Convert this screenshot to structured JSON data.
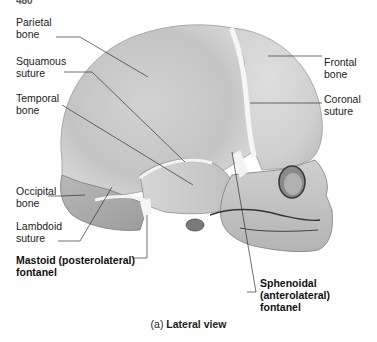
{
  "page_number": "480",
  "figure": {
    "caption_prefix": "(a)",
    "caption_title": "Lateral view"
  },
  "labels": {
    "parietal_bone": "Parietal\nbone",
    "squamous_suture": "Squamous\nsuture",
    "temporal_bone": "Temporal\nbone",
    "occipital_bone": "Occipital\nbone",
    "lambdoid_suture": "Lambdoid\nsuture",
    "mastoid_fontanel": "Mastoid (posterolateral)\nfontanel",
    "frontal_bone": "Frontal\nbone",
    "coronal_suture": "Coronal\nsuture",
    "sphenoidal_fontanel": "Sphenoidal\n(anterolateral)\nfontanel"
  },
  "colors": {
    "bone_light": "#e6e6e6",
    "bone_mid": "#c9c9c9",
    "bone_dark": "#a8a8a8",
    "suture": "#f7f7f7",
    "leader_line": "#333333"
  }
}
